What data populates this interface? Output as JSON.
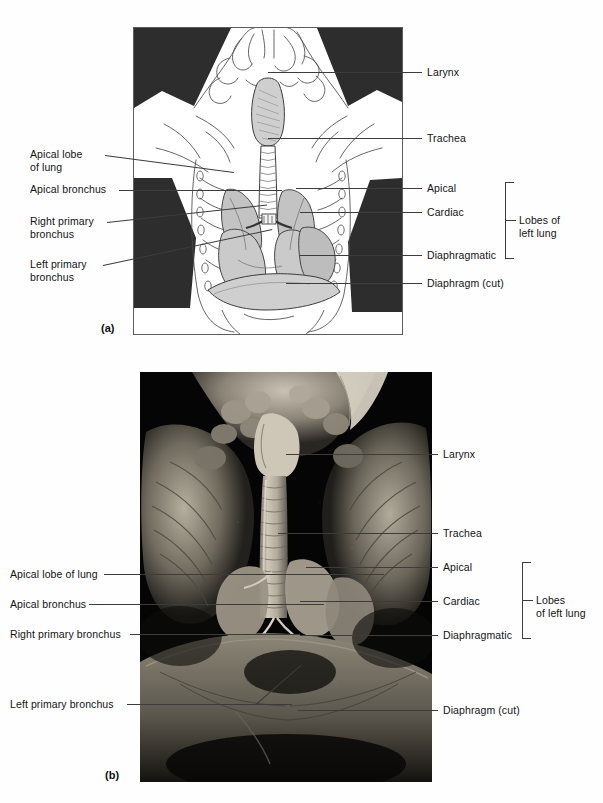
{
  "figure": {
    "panels": [
      {
        "id": "a",
        "letter": "(a)",
        "kind": "line-drawing"
      },
      {
        "id": "b",
        "letter": "(b)",
        "kind": "photograph"
      }
    ]
  },
  "panel_a": {
    "letter": "(a)",
    "labels_left": [
      {
        "name": "apical-lobe-of-lung",
        "text": "Apical lobe\nof lung"
      },
      {
        "name": "apical-bronchus",
        "text": "Apical bronchus"
      },
      {
        "name": "right-primary-bronchus",
        "text": "Right primary\nbronchus"
      },
      {
        "name": "left-primary-bronchus",
        "text": "Left primary\nbronchus"
      }
    ],
    "labels_right": [
      {
        "name": "larynx",
        "text": "Larynx"
      },
      {
        "name": "trachea",
        "text": "Trachea"
      },
      {
        "name": "apical",
        "text": "Apical"
      },
      {
        "name": "cardiac",
        "text": "Cardiac"
      },
      {
        "name": "diaphragmatic",
        "text": "Diaphragmatic"
      },
      {
        "name": "diaphragm-cut",
        "text": "Diaphragm (cut)"
      }
    ],
    "bracket_label": "Lobes of\nleft lung"
  },
  "panel_b": {
    "letter": "(b)",
    "labels_left": [
      {
        "name": "apical-lobe-of-lung",
        "text": "Apical lobe of lung"
      },
      {
        "name": "apical-bronchus",
        "text": "Apical bronchus"
      },
      {
        "name": "right-primary-bronchus",
        "text": "Right primary bronchus"
      },
      {
        "name": "left-primary-bronchus",
        "text": "Left primary bronchus"
      }
    ],
    "labels_right": [
      {
        "name": "larynx",
        "text": "Larynx"
      },
      {
        "name": "trachea",
        "text": "Trachea"
      },
      {
        "name": "apical",
        "text": "Apical"
      },
      {
        "name": "cardiac",
        "text": "Cardiac"
      },
      {
        "name": "diaphragmatic",
        "text": "Diaphragmatic"
      },
      {
        "name": "diaphragm-cut",
        "text": "Diaphragm (cut)"
      }
    ],
    "bracket_label": "Lobes\nof left lung"
  },
  "colors": {
    "page_background": "#ffffff",
    "text": "#131313",
    "leader_line": "#3c3c3c",
    "drawing_outline": "#444444",
    "drawing_shadow_black": "#2b2b2b",
    "lung_fill": "#c9c9c9",
    "photo_background": "#050505",
    "tissue_light": "#b9b3a6",
    "tissue_mid": "#7d776c"
  }
}
